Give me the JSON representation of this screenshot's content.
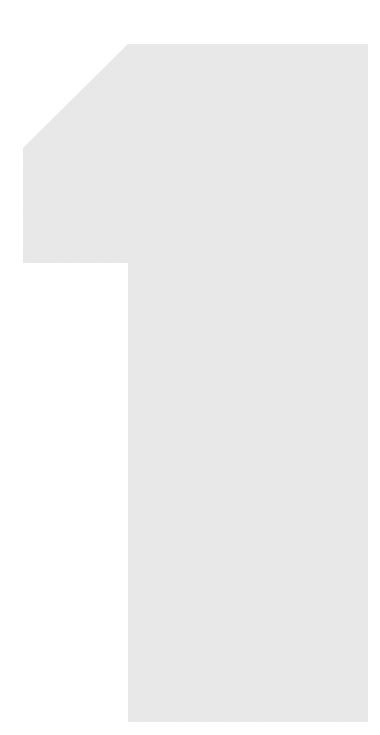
{
  "figure": {
    "glyph": "1",
    "fill_color": "#e4e4e4",
    "background_color": "#ffffff"
  }
}
